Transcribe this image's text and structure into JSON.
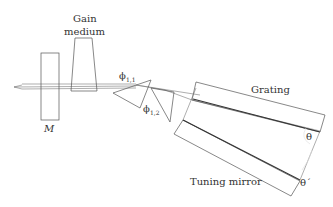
{
  "diagram": {
    "type": "optical-setup",
    "labels": {
      "gain_medium_line1": "Gain",
      "gain_medium_line2": "medium",
      "mirror": "M",
      "grating": "Grating",
      "tuning_mirror": "Tuning mirror",
      "phi_11": "ϕ",
      "phi_11_sub": "1,1",
      "phi_12": "ϕ",
      "phi_12_sub": "1,2",
      "theta": "θ",
      "theta_prime": "θ´"
    },
    "components": [
      "output-mirror-M",
      "gain-medium",
      "prism-1",
      "prism-2",
      "grating",
      "tuning-mirror"
    ],
    "colors": {
      "line": "#555555",
      "beam": "#777777",
      "text": "#333333",
      "background": "#ffffff"
    }
  }
}
